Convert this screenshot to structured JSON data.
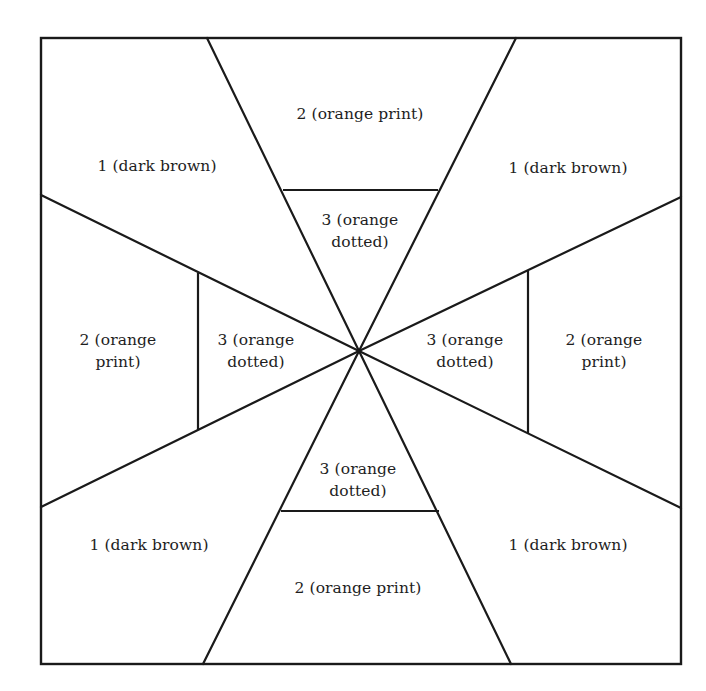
{
  "diagram": {
    "square": {
      "x1": 41,
      "y1": 38,
      "x2": 681,
      "y2": 664
    },
    "center": {
      "x": 359,
      "y": 351
    },
    "spoke_ends": [
      {
        "x": 207,
        "y": 38
      },
      {
        "x": 516,
        "y": 38
      },
      {
        "x": 681,
        "y": 197
      },
      {
        "x": 681,
        "y": 508
      },
      {
        "x": 511,
        "y": 664
      },
      {
        "x": 203,
        "y": 664
      },
      {
        "x": 41,
        "y": 507
      },
      {
        "x": 41,
        "y": 195
      }
    ],
    "inner_bars": [
      {
        "position": "top",
        "x1": 283,
        "y1": 190,
        "x2": 438,
        "y2": 190
      },
      {
        "position": "right",
        "x1": 528,
        "y1": 271,
        "x2": 528,
        "y2": 433
      },
      {
        "position": "bottom",
        "x1": 281,
        "y1": 511,
        "x2": 439,
        "y2": 511
      },
      {
        "position": "left",
        "x1": 198,
        "y1": 273,
        "x2": 198,
        "y2": 430
      }
    ],
    "stroke_color": "#1a1a1a",
    "background_color": "#ffffff"
  },
  "regions": {
    "corner_top_left": {
      "line1": "1 (dark brown)",
      "x": 157,
      "y": 166
    },
    "corner_top_right": {
      "line1": "1 (dark brown)",
      "x": 568,
      "y": 168
    },
    "corner_bottom_left": {
      "line1": "1 (dark brown)",
      "x": 149,
      "y": 545
    },
    "corner_bottom_right": {
      "line1": "1 (dark brown)",
      "x": 568,
      "y": 545
    },
    "outer_top": {
      "line1": "2 (orange print)",
      "x": 360,
      "y": 114
    },
    "outer_bottom": {
      "line1": "2 (orange print)",
      "x": 358,
      "y": 588
    },
    "outer_left": {
      "line1": "2 (orange",
      "line2": "print)",
      "x": 118,
      "y": 351
    },
    "outer_right": {
      "line1": "2 (orange",
      "line2": "print)",
      "x": 604,
      "y": 351
    },
    "inner_top": {
      "line1": "3 (orange",
      "line2": "dotted)",
      "x": 360,
      "y": 231
    },
    "inner_bottom": {
      "line1": "3 (orange",
      "line2": "dotted)",
      "x": 358,
      "y": 480
    },
    "inner_left": {
      "line1": "3 (orange",
      "line2": "dotted)",
      "x": 256,
      "y": 351
    },
    "inner_right": {
      "line1": "3 (orange",
      "line2": "dotted)",
      "x": 465,
      "y": 351
    }
  },
  "legend_key": [
    {
      "number": "1",
      "fabric": "dark brown"
    },
    {
      "number": "2",
      "fabric": "orange print"
    },
    {
      "number": "3",
      "fabric": "orange dotted"
    }
  ]
}
